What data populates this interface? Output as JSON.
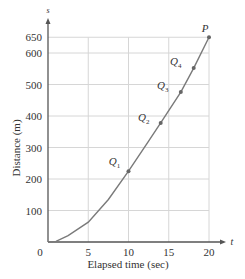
{
  "chart_data": {
    "type": "line",
    "title": "",
    "xlabel": "Elapsed time (sec)",
    "ylabel": "Distance (m)",
    "x_axis_symbol": "t",
    "y_axis_symbol": "s",
    "xlim": [
      0,
      21
    ],
    "ylim": [
      0,
      670
    ],
    "x_ticks": [
      0,
      5,
      10,
      15,
      20
    ],
    "y_ticks": [
      100,
      200,
      300,
      400,
      500,
      600,
      650
    ],
    "grid": true,
    "series": [
      {
        "name": "s(t)",
        "x": [
          0,
          1,
          2.5,
          5,
          7.5,
          10,
          12.5,
          14,
          16.5,
          18.1,
          20
        ],
        "values": [
          0,
          2,
          20,
          63,
          135,
          225,
          320,
          378,
          476,
          552,
          650
        ]
      }
    ],
    "points": [
      {
        "label": "Q",
        "sub": "1",
        "t": 10,
        "s": 225
      },
      {
        "label": "Q",
        "sub": "2",
        "t": 14,
        "s": 378
      },
      {
        "label": "Q",
        "sub": "3",
        "t": 16.5,
        "s": 476
      },
      {
        "label": "Q",
        "sub": "4",
        "t": 18.1,
        "s": 552
      },
      {
        "label": "P",
        "sub": "",
        "t": 20,
        "s": 650
      }
    ],
    "colors": {
      "curve": "#7a7a7a",
      "grid": "#d6d6d6",
      "axis": "#555555",
      "point": "#666666"
    }
  }
}
